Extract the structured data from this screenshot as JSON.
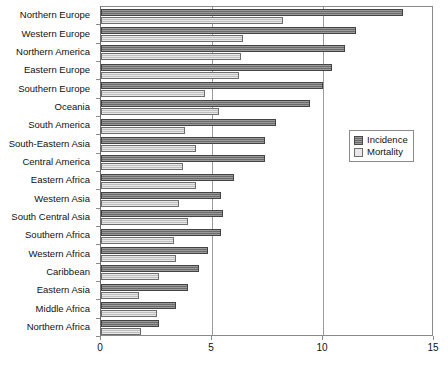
{
  "chart_data": {
    "type": "bar",
    "orientation": "horizontal",
    "title": "",
    "subtitle": "",
    "xlabel": "",
    "ylabel": "",
    "xlim": [
      0,
      15
    ],
    "xticks": [
      0,
      5,
      10,
      15
    ],
    "xtick_labels": [
      "0",
      "5",
      "10",
      "15"
    ],
    "grid": true,
    "grid_axis": "x",
    "legend_position": "right",
    "categories": [
      "Northern Europe",
      "Western Europe",
      "Northern America",
      "Eastern Europe",
      "Southern Europe",
      "Oceania",
      "South America",
      "South-Eastern Asia",
      "Central America",
      "Eastern Africa",
      "Western Asia",
      "South Central Asia",
      "Southern Africa",
      "Western Africa",
      "Caribbean",
      "Eastern Asia",
      "Middle Africa",
      "Northern Africa"
    ],
    "series": [
      {
        "name": "Incidence",
        "color": "#777777",
        "values": [
          13.6,
          11.5,
          11.0,
          10.4,
          10.0,
          9.4,
          7.9,
          7.4,
          7.4,
          6.0,
          5.4,
          5.5,
          5.4,
          4.8,
          4.4,
          3.9,
          3.4,
          2.6
        ]
      },
      {
        "name": "Mortality",
        "color": "#cbcbcb",
        "values": [
          8.2,
          6.4,
          6.3,
          6.2,
          4.7,
          5.3,
          3.8,
          4.3,
          3.7,
          4.3,
          3.5,
          3.9,
          3.3,
          3.4,
          2.6,
          1.7,
          2.5,
          1.8
        ]
      }
    ]
  },
  "legend": {
    "entries": [
      {
        "label": "Incidence"
      },
      {
        "label": "Mortality"
      }
    ]
  }
}
